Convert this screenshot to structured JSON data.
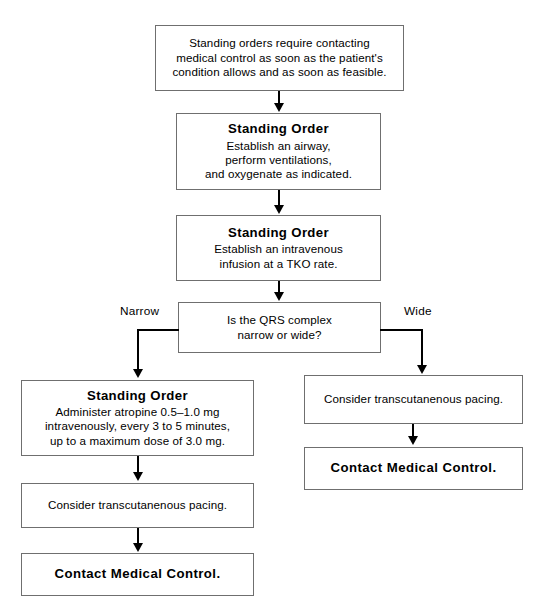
{
  "diagram": {
    "type": "flowchart",
    "orientation": "top-to-bottom",
    "colors": {
      "box_border": "#6f6f6f",
      "connector": "#000000",
      "background": "#ffffff",
      "text": "#000000"
    },
    "nodes": [
      {
        "id": "intro",
        "shape": "rectangle",
        "emphasis": "none",
        "lines": [
          "Standing orders require contacting",
          "medical control as soon as the patient's",
          "condition allows and as soon as feasible."
        ]
      },
      {
        "id": "airway",
        "shape": "rectangle",
        "emphasis": "header",
        "header": "Standing Order",
        "lines": [
          "Establish an airway,",
          "perform ventilations,",
          "and oxygenate as indicated."
        ]
      },
      {
        "id": "iv",
        "shape": "rectangle",
        "emphasis": "header",
        "header": "Standing Order",
        "lines": [
          "Establish an intravenous",
          "infusion at a TKO rate."
        ]
      },
      {
        "id": "decision-qrs",
        "shape": "rectangle",
        "emphasis": "none",
        "lines": [
          "Is the QRS complex",
          "narrow or wide?"
        ]
      },
      {
        "id": "atropine",
        "shape": "rectangle",
        "emphasis": "header",
        "header": "Standing Order",
        "lines": [
          "Administer atropine 0.5–1.0 mg",
          "intravenously, every 3 to 5 minutes,",
          "up to a maximum dose of 3.0 mg."
        ]
      },
      {
        "id": "pacing-left",
        "shape": "rectangle",
        "emphasis": "none",
        "lines": [
          "Consider transcutanenous pacing."
        ]
      },
      {
        "id": "contact-left",
        "shape": "rectangle",
        "emphasis": "bold",
        "lines": [
          "Contact Medical Control."
        ]
      },
      {
        "id": "pacing-right",
        "shape": "rectangle",
        "emphasis": "none",
        "lines": [
          "Consider transcutanenous pacing."
        ]
      },
      {
        "id": "contact-right",
        "shape": "bold",
        "emphasis": "bold",
        "lines": [
          "Contact Medical Control."
        ]
      }
    ],
    "edge_labels": {
      "narrow": "Narrow",
      "wide": "Wide"
    }
  }
}
